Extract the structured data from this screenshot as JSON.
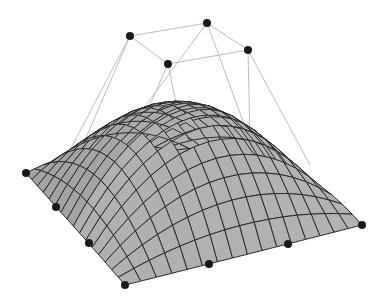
{
  "diagram": {
    "type": "bezier-surface",
    "colors": {
      "background": "#ffffff",
      "surface_light": "#c8c8c8",
      "surface_dark": "#8a8a8a",
      "isoline": "#2a2a2a",
      "control_net": "#bdbdbd",
      "control_point": "#1a1a1a"
    },
    "grid_divisions": 16,
    "control_points_2d": [
      [
        [
          26,
          173
        ],
        [
          56,
          207
        ],
        [
          89,
          243
        ],
        [
          125,
          285
        ]
      ],
      [
        [
          70,
          150
        ],
        [
          130,
          36
        ],
        [
          168,
          64
        ],
        [
          209,
          264
        ]
      ],
      [
        [
          120,
          140
        ],
        [
          207,
          23
        ],
        [
          248,
          50
        ],
        [
          288,
          244
        ]
      ],
      [
        [
          175,
          150
        ],
        [
          250,
          140
        ],
        [
          310,
          165
        ],
        [
          362,
          225
        ]
      ]
    ],
    "depth": [
      [
        0,
        0,
        0,
        0
      ],
      [
        0,
        1.6,
        1.6,
        0
      ],
      [
        0,
        1.6,
        1.6,
        0
      ],
      [
        0,
        0,
        0,
        0
      ]
    ],
    "visible_control_points": [
      [
        26,
        173
      ],
      [
        56,
        207
      ],
      [
        89,
        243
      ],
      [
        125,
        285
      ],
      [
        209,
        264
      ],
      [
        288,
        244
      ],
      [
        362,
        225
      ],
      [
        130,
        36
      ],
      [
        207,
        23
      ],
      [
        248,
        50
      ],
      [
        168,
        64
      ]
    ],
    "control_net_edges": [
      [
        [
          130,
          36
        ],
        [
          207,
          23
        ]
      ],
      [
        [
          207,
          23
        ],
        [
          248,
          50
        ]
      ],
      [
        [
          248,
          50
        ],
        [
          168,
          64
        ]
      ],
      [
        [
          168,
          64
        ],
        [
          130,
          36
        ]
      ],
      [
        [
          130,
          36
        ],
        [
          56,
          207
        ]
      ],
      [
        [
          130,
          36
        ],
        [
          70,
          150
        ]
      ],
      [
        [
          168,
          64
        ],
        [
          89,
          243
        ]
      ],
      [
        [
          168,
          64
        ],
        [
          209,
          264
        ]
      ],
      [
        [
          207,
          23
        ],
        [
          120,
          140
        ]
      ],
      [
        [
          207,
          23
        ],
        [
          288,
          244
        ]
      ],
      [
        [
          248,
          50
        ],
        [
          250,
          140
        ]
      ],
      [
        [
          248,
          50
        ],
        [
          310,
          165
        ]
      ]
    ]
  }
}
